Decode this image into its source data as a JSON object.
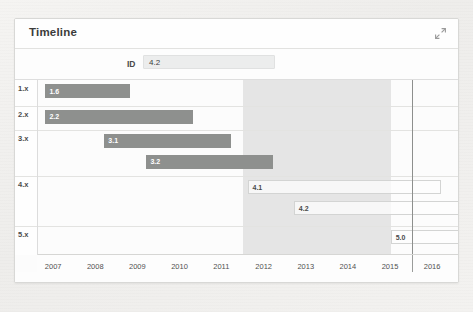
{
  "card": {
    "title": "Timeline",
    "expand_icon": "expand-diagonal-arrow-icon"
  },
  "filter": {
    "label": "ID",
    "value": "4.2",
    "placeholder": ""
  },
  "chart_data": {
    "type": "bar",
    "orientation": "horizontal",
    "title": "Timeline",
    "xlabel": "",
    "ylabel": "",
    "xlim": [
      2006.6,
      2016.6
    ],
    "grid": true,
    "legend": "none",
    "categories": [
      "1.x",
      "2.x",
      "3.x",
      "4.x",
      "5.x"
    ],
    "tick_labels": [
      "2007",
      "2008",
      "2009",
      "2010",
      "2011",
      "2012",
      "2013",
      "2014",
      "2015",
      "2016"
    ],
    "tick_values": [
      2007,
      2008,
      2009,
      2010,
      2011,
      2012,
      2013,
      2014,
      2015,
      2016
    ],
    "highlight_span": {
      "start": 2011.5,
      "end": 2015.0
    },
    "marker_year": 2015.5,
    "bars": [
      {
        "label": "1.6",
        "row": "1.x",
        "start": 2006.8,
        "end": 2008.8,
        "style": "solid"
      },
      {
        "label": "2.2",
        "row": "2.x",
        "start": 2006.8,
        "end": 2010.3,
        "style": "solid"
      },
      {
        "label": "3.1",
        "row": "3.x",
        "start": 2008.2,
        "end": 2011.2,
        "style": "solid"
      },
      {
        "label": "3.2",
        "row": "3.x",
        "start": 2009.2,
        "end": 2012.2,
        "style": "solid"
      },
      {
        "label": "4.1",
        "row": "4.x",
        "start": 2011.6,
        "end": 2016.2,
        "style": "hollow"
      },
      {
        "label": "4.2",
        "row": "4.x",
        "start": 2012.7,
        "end": 2016.7,
        "style": "hollow"
      },
      {
        "label": "5.0",
        "row": "5.x",
        "start": 2015.0,
        "end": 2016.7,
        "style": "hollow"
      }
    ]
  }
}
